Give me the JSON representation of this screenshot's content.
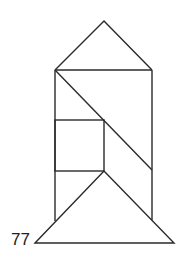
{
  "figure": {
    "label": "77",
    "stroke_color": "#2a2a2a",
    "background": "#ffffff",
    "shapes": [
      {
        "name": "roof-triangle",
        "points": [
          [
            55,
            70
          ],
          [
            104,
            21
          ],
          [
            152,
            70
          ]
        ]
      },
      {
        "name": "upper-left-triangle",
        "points": [
          [
            55,
            70
          ],
          [
            152,
            70
          ],
          [
            152,
            170
          ]
        ]
      },
      {
        "name": "left-strip",
        "points": [
          [
            55,
            70
          ],
          [
            104,
            120
          ],
          [
            55,
            120
          ]
        ]
      },
      {
        "name": "square",
        "points": [
          [
            55,
            120
          ],
          [
            104,
            120
          ],
          [
            104,
            171
          ],
          [
            55,
            171
          ]
        ]
      },
      {
        "name": "parallelogram",
        "points": [
          [
            104,
            120
          ],
          [
            152,
            170
          ],
          [
            152,
            220
          ],
          [
            104,
            171
          ]
        ]
      },
      {
        "name": "left-small-triangle",
        "points": [
          [
            55,
            171
          ],
          [
            104,
            171
          ],
          [
            55,
            221
          ]
        ]
      },
      {
        "name": "base-triangle",
        "points": [
          [
            35,
            243
          ],
          [
            104,
            171
          ],
          [
            174,
            243
          ]
        ]
      }
    ]
  }
}
